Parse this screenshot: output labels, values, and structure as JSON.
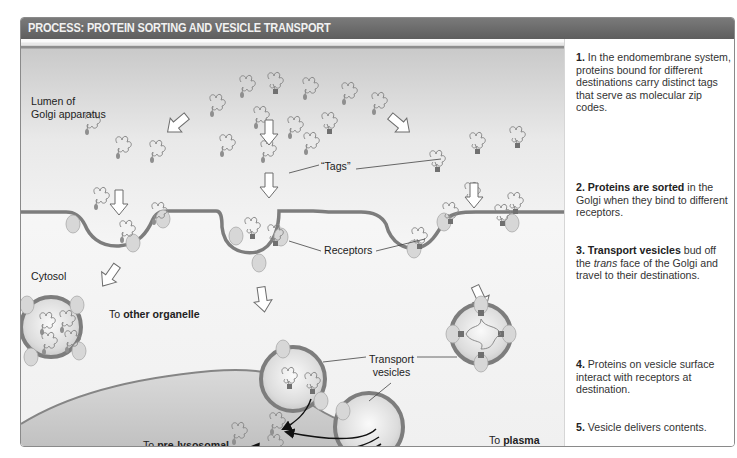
{
  "header": {
    "title": "PROCESS: PROTEIN SORTING AND VESICLE TRANSPORT"
  },
  "diagram": {
    "labels": {
      "lumen_line1": "Lumen of",
      "lumen_line2": "Golgi apparatus",
      "cytosol": "Cytosol",
      "tags": "“Tags”",
      "receptors": "Receptors",
      "to_other_prefix": "To ",
      "to_other_bold": "other organelle",
      "transport_line1": "Transport",
      "transport_line2": "vesicles",
      "plasma_prefix": "To ",
      "plasma_bold1": "plasma",
      "plasma_bold2": "membrane",
      "plasma_suffix": "for secretion",
      "lyso_prefix": "To ",
      "lyso_bold1": "pre-lysosomal",
      "lyso_bold2": "compartment"
    },
    "colors": {
      "header_bg": "#666666",
      "membrane": "#7d7d7d",
      "lumen_top": "#cfcfcf",
      "lumen_bottom": "#f4f4f4",
      "tag": "#6f6f6f"
    }
  },
  "steps": [
    {
      "num": "1.",
      "bold": "",
      "text": " In the endomembrane system, proteins bound for different destinations carry distinct tags that serve as molecular zip codes."
    },
    {
      "num": "2.",
      "bold": " Proteins are sorted",
      "text": " in the Golgi when they bind to different receptors."
    },
    {
      "num": "3.",
      "bold": " Transport vesicles",
      "text_a": " bud off the ",
      "italic": "trans",
      "text_b": " face of the Golgi and travel to their destinations."
    },
    {
      "num": "4.",
      "bold": "",
      "text": " Proteins on vesicle surface interact with receptors at destination."
    },
    {
      "num": "5.",
      "bold": "",
      "text": " Vesicle delivers contents."
    }
  ]
}
